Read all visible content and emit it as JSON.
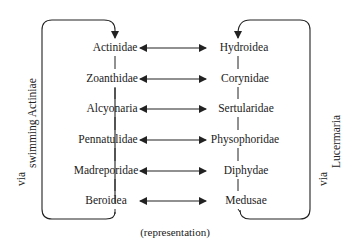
{
  "diagram": {
    "left_column": [
      "Actinidae",
      "Zoanthidae",
      "Alcyonaria",
      "Pennatulidae",
      "Madreporidae",
      "Beroidea"
    ],
    "right_column": [
      "Hydroidea",
      "Corynidae",
      "Sertularidae",
      "Physophoridae",
      "Diphydae",
      "Medusae"
    ],
    "row_connectors": "double-headed-arrow",
    "left_loop": {
      "via": "via",
      "label": "swimming Actiniae"
    },
    "right_loop": {
      "via": "via",
      "label": "Lucermaria"
    },
    "caption": "(representation)",
    "line_color": "#222222"
  }
}
